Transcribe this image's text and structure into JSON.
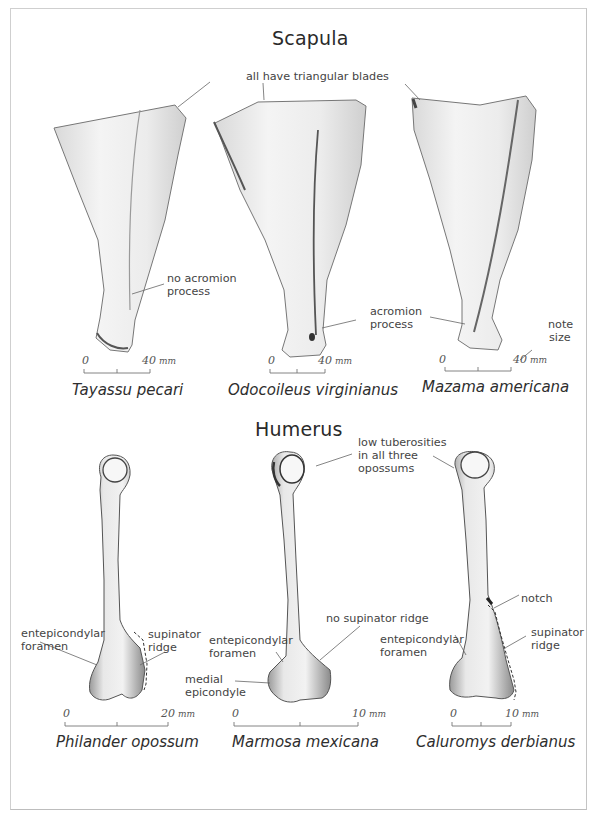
{
  "figure": {
    "border_color": "#cfcfcf",
    "sections": [
      {
        "title": "Scapula",
        "shared_annotation": "all have triangular blades",
        "specimens": [
          {
            "species": "Tayassu pecari",
            "annotations": [
              "no acromion",
              "process"
            ],
            "scale": {
              "start": "0",
              "end": "40",
              "unit": "mm"
            }
          },
          {
            "species": "Odocoileus virginianus",
            "annotations": [
              "acromion",
              "process"
            ],
            "scale": {
              "start": "0",
              "end": "40",
              "unit": "mm"
            }
          },
          {
            "species": "Mazama americana",
            "annotations": [
              "note",
              "size"
            ],
            "scale": {
              "start": "0",
              "end": "40",
              "unit": "mm"
            }
          }
        ]
      },
      {
        "title": "Humerus",
        "shared_annotation": [
          "low tuberosities",
          "in all three",
          "opossums"
        ],
        "specimens": [
          {
            "species": "Philander opossum",
            "annotations": {
              "left": [
                "entepicondylar",
                "foramen"
              ],
              "right": [
                "supinator",
                "ridge"
              ]
            },
            "scale": {
              "start": "0",
              "end": "20",
              "unit": "mm"
            }
          },
          {
            "species": "Marmosa mexicana",
            "annotations": {
              "foramen": [
                "entepicondylar",
                "foramen"
              ],
              "epicondyle": [
                "medial",
                "epicondyle"
              ],
              "ridge": "no supinator ridge"
            },
            "scale": {
              "start": "0",
              "end": "10",
              "unit": "mm"
            }
          },
          {
            "species": "Caluromys derbianus",
            "annotations": {
              "notch": "notch",
              "foramen": [
                "entepicondylar",
                "foramen"
              ],
              "ridge": [
                "supinator",
                "ridge"
              ]
            },
            "scale": {
              "start": "0",
              "end": "10",
              "unit": "mm"
            }
          }
        ]
      }
    ]
  }
}
